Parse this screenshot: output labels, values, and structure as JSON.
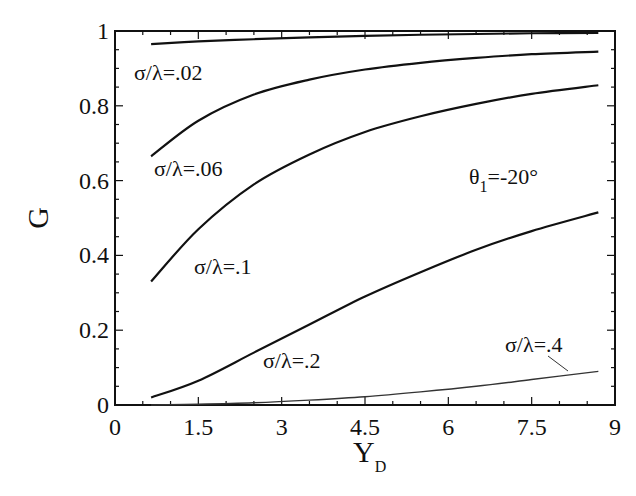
{
  "chart_data": {
    "type": "line",
    "title": "",
    "xlabel": "Y_D",
    "xlabel_main": "Y",
    "xlabel_sub": "D",
    "ylabel": "G",
    "xlim": [
      0,
      9
    ],
    "ylim": [
      0,
      1
    ],
    "grid": false,
    "legend_position": "inline annotations",
    "x_ticks": [
      "0",
      "1.5",
      "3",
      "4.5",
      "6",
      "7.5",
      "9"
    ],
    "y_ticks": [
      "0",
      "0.2",
      "0.4",
      "0.6",
      "0.8",
      "1"
    ],
    "annotation": {
      "main": "θ",
      "sub": "1",
      "rest": "=-20°",
      "full": "θ1=-20°"
    },
    "x": [
      0.65,
      1.5,
      2.5,
      3.5,
      4.5,
      5.5,
      6.5,
      7.5,
      8.7
    ],
    "series": [
      {
        "name": "σ/λ=.02",
        "label": "σ/λ=.02",
        "values": [
          0.965,
          0.972,
          0.978,
          0.983,
          0.987,
          0.99,
          0.992,
          0.994,
          0.995
        ]
      },
      {
        "name": "σ/λ=.06",
        "label": "σ/λ=.06",
        "values": [
          0.665,
          0.76,
          0.83,
          0.87,
          0.897,
          0.915,
          0.928,
          0.938,
          0.945
        ]
      },
      {
        "name": "σ/λ=.1",
        "label": "σ/λ=.1",
        "values": [
          0.33,
          0.47,
          0.59,
          0.67,
          0.73,
          0.772,
          0.805,
          0.832,
          0.855
        ]
      },
      {
        "name": "σ/λ=.2",
        "label": "σ/λ=.2",
        "values": [
          0.02,
          0.065,
          0.14,
          0.215,
          0.29,
          0.355,
          0.415,
          0.465,
          0.515
        ]
      },
      {
        "name": "σ/λ=.4",
        "label": "σ/λ=.4",
        "values": [
          0.0,
          0.002,
          0.006,
          0.013,
          0.022,
          0.035,
          0.05,
          0.068,
          0.09
        ]
      }
    ]
  }
}
